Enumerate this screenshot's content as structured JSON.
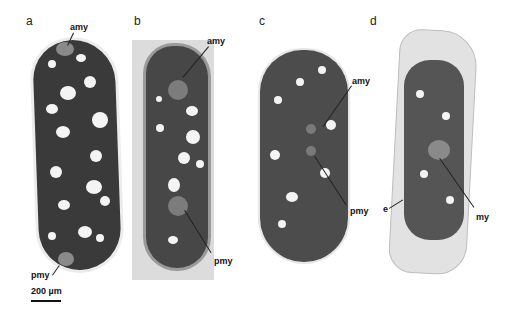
{
  "figure": {
    "panels": [
      {
        "letter": "a",
        "labels": {
          "top": "amy",
          "bottom": "pmy"
        }
      },
      {
        "letter": "b",
        "labels": {
          "top": "amy",
          "bottom": "pmy"
        }
      },
      {
        "letter": "c",
        "labels": {
          "top": "amy",
          "bottom": "pmy"
        }
      },
      {
        "letter": "d",
        "labels": {
          "left": "e",
          "right": "my"
        }
      }
    ],
    "scale_bar": {
      "label": "200 µm"
    }
  }
}
